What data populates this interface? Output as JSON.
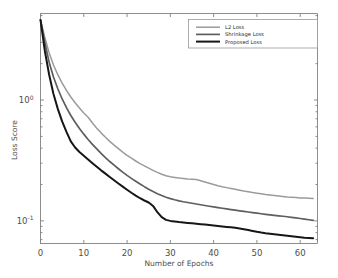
{
  "chart_data": {
    "type": "line",
    "title": "",
    "xlabel": "Number of Epochs",
    "ylabel": "Loss Score",
    "yscale": "log",
    "xlim": [
      0,
      64
    ],
    "ylim": [
      0.065,
      5.2
    ],
    "xticks": [
      "0",
      "10",
      "20",
      "30",
      "40",
      "50",
      "60"
    ],
    "xtick_values": [
      0,
      10,
      20,
      30,
      40,
      50,
      60
    ],
    "yticks": [
      "10^0",
      "10^-1"
    ],
    "ytick_values": [
      1,
      0.1
    ],
    "grid": false,
    "legend_position": "upper right",
    "x": [
      0,
      1,
      2,
      3,
      4,
      5,
      6,
      7,
      8,
      9,
      10,
      11,
      12,
      13,
      14,
      15,
      16,
      17,
      18,
      19,
      20,
      21,
      22,
      23,
      24,
      25,
      26,
      27,
      28,
      29,
      30,
      31,
      32,
      33,
      34,
      35,
      36,
      37,
      38,
      39,
      40,
      41,
      42,
      43,
      44,
      45,
      46,
      47,
      48,
      49,
      50,
      51,
      52,
      53,
      54,
      55,
      56,
      57,
      58,
      59,
      60,
      61,
      62,
      63
    ],
    "series": [
      {
        "name": "L2 Loss",
        "color": "#9b9b9b",
        "width": 1.5,
        "values": [
          4.6,
          3.3,
          2.45,
          1.95,
          1.62,
          1.38,
          1.2,
          1.06,
          0.95,
          0.86,
          0.78,
          0.72,
          0.645,
          0.585,
          0.535,
          0.492,
          0.455,
          0.424,
          0.396,
          0.371,
          0.349,
          0.33,
          0.313,
          0.298,
          0.285,
          0.273,
          0.262,
          0.252,
          0.243,
          0.236,
          0.232,
          0.229,
          0.226,
          0.224,
          0.222,
          0.221,
          0.22,
          0.215,
          0.21,
          0.205,
          0.2,
          0.1955,
          0.1915,
          0.1885,
          0.1855,
          0.1825,
          0.1795,
          0.1765,
          0.174,
          0.1715,
          0.1695,
          0.1675,
          0.1655,
          0.164,
          0.1625,
          0.161,
          0.1595,
          0.158,
          0.157,
          0.156,
          0.155,
          0.1545,
          0.154,
          0.1535
        ]
      },
      {
        "name": "Shrinkage Loss",
        "color": "#5e5e5e",
        "width": 1.7,
        "values": [
          4.6,
          3.0,
          2.05,
          1.55,
          1.24,
          1.02,
          0.865,
          0.745,
          0.655,
          0.582,
          0.522,
          0.472,
          0.43,
          0.394,
          0.362,
          0.334,
          0.31,
          0.289,
          0.27,
          0.253,
          0.238,
          0.225,
          0.213,
          0.202,
          0.192,
          0.183,
          0.175,
          0.168,
          0.162,
          0.157,
          0.153,
          0.1495,
          0.1465,
          0.144,
          0.142,
          0.14,
          0.138,
          0.136,
          0.134,
          0.1322,
          0.1305,
          0.1288,
          0.1272,
          0.1256,
          0.124,
          0.1226,
          0.1212,
          0.1198,
          0.1184,
          0.117,
          0.1158,
          0.1146,
          0.1134,
          0.1122,
          0.1112,
          0.1102,
          0.1092,
          0.1082,
          0.107,
          0.1058,
          0.1046,
          0.1034,
          0.1022,
          0.101
        ]
      },
      {
        "name": "Proposed Loss",
        "color": "#161616",
        "width": 2.0,
        "values": [
          4.6,
          2.55,
          1.62,
          1.12,
          0.845,
          0.665,
          0.545,
          0.455,
          0.405,
          0.372,
          0.346,
          0.322,
          0.3,
          0.28,
          0.262,
          0.246,
          0.231,
          0.217,
          0.204,
          0.192,
          0.181,
          0.171,
          0.162,
          0.154,
          0.1475,
          0.142,
          0.133,
          0.118,
          0.1075,
          0.102,
          0.1,
          0.0988,
          0.0978,
          0.097,
          0.0962,
          0.0955,
          0.0948,
          0.094,
          0.0932,
          0.0924,
          0.0916,
          0.0908,
          0.09,
          0.0892,
          0.0884,
          0.0876,
          0.0866,
          0.0854,
          0.084,
          0.0826,
          0.0812,
          0.08,
          0.079,
          0.0782,
          0.0775,
          0.0768,
          0.076,
          0.0752,
          0.0745,
          0.0738,
          0.0732,
          0.0726,
          0.0722,
          0.0718
        ]
      }
    ]
  },
  "legend": {
    "items": [
      {
        "label": "L2 Loss"
      },
      {
        "label": "Shrinkage Loss"
      },
      {
        "label": "Proposed Loss"
      }
    ]
  },
  "axes": {
    "x_title": "Number of Epochs",
    "y_title": "Loss Score",
    "x_tick_labels": [
      "0",
      "10",
      "20",
      "30",
      "40",
      "50",
      "60"
    ],
    "y_tick_labels": [
      {
        "base": "10",
        "exp": "0"
      },
      {
        "base": "10",
        "exp": "-1"
      }
    ]
  }
}
